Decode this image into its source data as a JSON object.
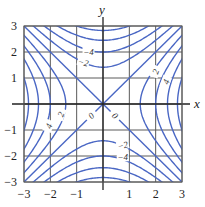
{
  "chart_data": {
    "type": "contour",
    "function": "x^2 - y^2",
    "title": "",
    "xlabel": "x",
    "ylabel": "y",
    "xlim": [
      -3,
      3
    ],
    "ylim": [
      -3,
      3
    ],
    "grid": true,
    "x_ticks": [
      "-3",
      "-2",
      "-1",
      "1",
      "2",
      "3"
    ],
    "y_ticks": [
      "3",
      "2",
      "1",
      "-1",
      "-2",
      "-3"
    ],
    "levels": [
      -8,
      -6,
      -4,
      -2,
      0,
      2,
      4,
      6,
      8
    ],
    "contour_labels": [
      {
        "text": "-4",
        "x": -0.55,
        "y": 2.0,
        "angle": 0
      },
      {
        "text": "-2",
        "x": -0.75,
        "y": 1.6,
        "angle": 15
      },
      {
        "text": "2",
        "x": 2.0,
        "y": 1.25,
        "angle": -70
      },
      {
        "text": "4",
        "x": 2.4,
        "y": 0.85,
        "angle": -70
      },
      {
        "text": "2",
        "x": -1.6,
        "y": -0.4,
        "angle": -70
      },
      {
        "text": "4",
        "x": -2.05,
        "y": -0.85,
        "angle": -70
      },
      {
        "text": "0",
        "x": -0.45,
        "y": -0.45,
        "angle": -45
      },
      {
        "text": "0",
        "x": 0.45,
        "y": -0.45,
        "angle": 45
      },
      {
        "text": "-2",
        "x": 0.75,
        "y": -1.6,
        "angle": -15
      },
      {
        "text": "-4",
        "x": 0.75,
        "y": -2.05,
        "angle": 0
      }
    ],
    "colors": {
      "contour": "#4a67c4",
      "grid": "#5a5a5a",
      "axis": "#222222"
    }
  }
}
